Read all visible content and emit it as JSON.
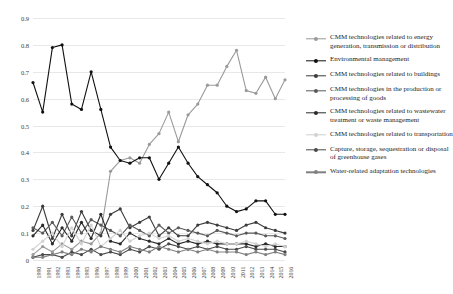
{
  "chart_data": {
    "type": "line",
    "title": "",
    "xlabel": "",
    "ylabel": "",
    "ylim": [
      0,
      0.9
    ],
    "grid": true,
    "legend_position": "right",
    "x": [
      "1990",
      "1991",
      "1992",
      "1993",
      "1994",
      "1995",
      "1996",
      "1997",
      "1998",
      "1999",
      "2000",
      "2001",
      "2002",
      "2003",
      "2004",
      "2005",
      "2006",
      "2007",
      "2008",
      "2009",
      "2010",
      "2011",
      "2012",
      "2013",
      "2014",
      "2015",
      "2016"
    ],
    "yticks": [
      "0",
      "0.1",
      "0.2",
      "0.3",
      "0.4",
      "0.5",
      "0.6",
      "0.7",
      "0.8",
      "0.9"
    ],
    "series": [
      {
        "name": "CMM technologies related to energy generation, transmission or distribution",
        "color": "#9a9a9a",
        "values": [
          0.02,
          0.05,
          0.03,
          0.06,
          0.04,
          0.07,
          0.06,
          0.1,
          0.33,
          0.37,
          0.38,
          0.36,
          0.43,
          0.47,
          0.55,
          0.44,
          0.54,
          0.58,
          0.65,
          0.65,
          0.72,
          0.78,
          0.63,
          0.62,
          0.68,
          0.6,
          0.67
        ]
      },
      {
        "name": "Environmental management",
        "color": "#111111",
        "values": [
          0.66,
          0.55,
          0.79,
          0.8,
          0.58,
          0.56,
          0.7,
          0.56,
          0.42,
          0.37,
          0.36,
          0.38,
          0.38,
          0.3,
          0.36,
          0.42,
          0.36,
          0.31,
          0.28,
          0.25,
          0.2,
          0.18,
          0.19,
          0.22,
          0.22,
          0.17,
          0.17
        ]
      },
      {
        "name": "CMM technologies related to buildings",
        "color": "#3c3c3c",
        "values": [
          0.11,
          0.2,
          0.08,
          0.17,
          0.09,
          0.18,
          0.11,
          0.09,
          0.17,
          0.19,
          0.12,
          0.14,
          0.16,
          0.09,
          0.12,
          0.09,
          0.09,
          0.13,
          0.14,
          0.13,
          0.12,
          0.11,
          0.13,
          0.14,
          0.12,
          0.11,
          0.1
        ]
      },
      {
        "name": "CMM technologies in the production or processing of goods",
        "color": "#5a5a5a",
        "values": [
          0.12,
          0.1,
          0.14,
          0.09,
          0.16,
          0.1,
          0.15,
          0.13,
          0.11,
          0.09,
          0.13,
          0.11,
          0.09,
          0.13,
          0.1,
          0.12,
          0.11,
          0.1,
          0.09,
          0.11,
          0.1,
          0.09,
          0.1,
          0.1,
          0.09,
          0.09,
          0.08
        ]
      },
      {
        "name": "CMM technologies related to wastewater treatment or waste management",
        "color": "#2a2a2a",
        "values": [
          0.09,
          0.13,
          0.06,
          0.12,
          0.07,
          0.14,
          0.08,
          0.17,
          0.07,
          0.06,
          0.1,
          0.08,
          0.07,
          0.06,
          0.08,
          0.06,
          0.07,
          0.06,
          0.07,
          0.06,
          0.06,
          0.06,
          0.06,
          0.05,
          0.06,
          0.05,
          0.05
        ]
      },
      {
        "name": "CMM technologies related to transportation",
        "color": "#d2d2d2",
        "values": [
          0.04,
          0.07,
          0.1,
          0.05,
          0.12,
          0.06,
          0.13,
          0.05,
          0.08,
          0.11,
          0.07,
          0.09,
          0.1,
          0.08,
          0.09,
          0.07,
          0.08,
          0.07,
          0.06,
          0.07,
          0.06,
          0.06,
          0.07,
          0.06,
          0.05,
          0.06,
          0.05
        ]
      },
      {
        "name": "Capture, storage, sequestration or disposal of greenhouse gases",
        "color": "#4a4a4a",
        "values": [
          0.01,
          0.02,
          0.02,
          0.01,
          0.03,
          0.02,
          0.04,
          0.02,
          0.03,
          0.02,
          0.04,
          0.03,
          0.05,
          0.04,
          0.06,
          0.05,
          0.04,
          0.05,
          0.04,
          0.05,
          0.04,
          0.04,
          0.05,
          0.04,
          0.04,
          0.04,
          0.03
        ]
      },
      {
        "name": "Water-related adaptation technologies",
        "color": "#808080",
        "values": [
          0.01,
          0.01,
          0.02,
          0.03,
          0.02,
          0.04,
          0.03,
          0.05,
          0.04,
          0.03,
          0.05,
          0.04,
          0.03,
          0.05,
          0.04,
          0.03,
          0.04,
          0.03,
          0.04,
          0.03,
          0.03,
          0.03,
          0.02,
          0.03,
          0.02,
          0.03,
          0.02
        ]
      }
    ]
  }
}
